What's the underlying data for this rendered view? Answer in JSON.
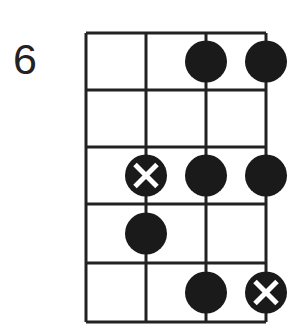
{
  "diagram": {
    "type": "fretboard-scale",
    "starting_fret": "6",
    "strings": 4,
    "frets": 5,
    "line_color": "#222222",
    "dot_color": "#1a1a1a",
    "root_mark_color": "#ffffff",
    "dots": [
      {
        "fret": 1,
        "string": 3,
        "root": false
      },
      {
        "fret": 1,
        "string": 4,
        "root": false
      },
      {
        "fret": 3,
        "string": 2,
        "root": true
      },
      {
        "fret": 3,
        "string": 3,
        "root": false
      },
      {
        "fret": 3,
        "string": 4,
        "root": false
      },
      {
        "fret": 4,
        "string": 2,
        "root": false
      },
      {
        "fret": 5,
        "string": 3,
        "root": false
      },
      {
        "fret": 5,
        "string": 4,
        "root": true
      }
    ]
  }
}
